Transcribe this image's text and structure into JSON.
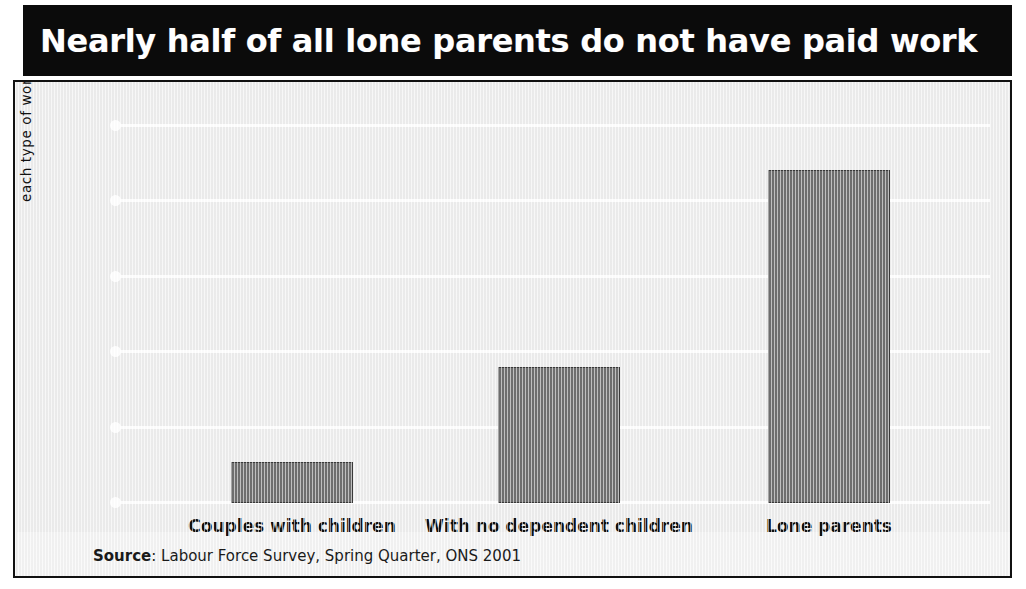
{
  "title": "Nearly half of all lone parents do not have paid work",
  "source": {
    "label": "Source",
    "separator": ": ",
    "text": "Labour Force Survey, Spring Quarter, ONS 2001"
  },
  "y_axis_title_line1": "Workless households as a percentage of",
  "y_axis_title_line2": "each type of working age household",
  "colors": {
    "banner_background": "#0b0b0b",
    "title_text": "#ffffff",
    "panel_background": "#eeeeee",
    "panel_border": "#111111",
    "bar_fill": "#6f6f6f",
    "bar_stroke": "#3a3a3a",
    "gridline": "#ffffff",
    "axis_text": "#111111"
  },
  "chart_data": {
    "type": "bar",
    "title": "Nearly half of all lone parents do not have paid work",
    "xlabel": "",
    "ylabel": "Workless households as a percentage of each type of working age household",
    "categories": [
      "Couples with children",
      "With no dependent children",
      "Lone parents"
    ],
    "values": [
      5.4,
      17.9,
      43.9
    ],
    "ylim": [
      0,
      50
    ],
    "yticks": [
      0,
      10,
      20,
      30,
      40,
      50
    ],
    "ytick_labels": [
      "0",
      "10",
      "20",
      "30",
      "40",
      "50"
    ],
    "grid": true,
    "grid_axis": "y",
    "legend": false,
    "legend_position": "none",
    "source": "Source: Labour Force Survey, Spring Quarter, ONS 2001"
  }
}
